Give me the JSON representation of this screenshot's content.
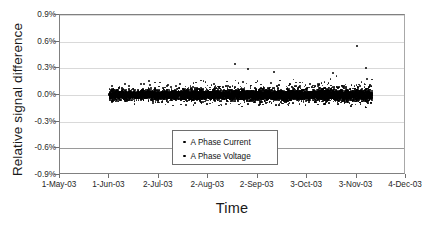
{
  "chart_data": {
    "type": "scatter",
    "title": "",
    "xlabel": "Time",
    "ylabel": "Relative signal difference",
    "grid": true,
    "legend_position": "inside-bottom-center",
    "ylim": [
      -0.9,
      0.9
    ],
    "yticks": [
      "0.9%",
      "0.6%",
      "0.3%",
      "0.0%",
      "-0.3%",
      "-0.6%",
      "-0.9%"
    ],
    "ytick_values": [
      0.9,
      0.6,
      0.3,
      0.0,
      -0.3,
      -0.6,
      -0.9
    ],
    "xticks": [
      "1-May-03",
      "1-Jun-03",
      "2-Jul-03",
      "2-Aug-03",
      "2-Sep-03",
      "3-Oct-03",
      "3-Nov-03",
      "4-Dec-03"
    ],
    "xtick_days": [
      0,
      31,
      62,
      93,
      124,
      155,
      186,
      217
    ],
    "xlim_days": [
      0,
      217
    ],
    "series": [
      {
        "name": "A Phase Current",
        "marker": "dot",
        "color": "#000000",
        "description": "Dense scatter band beginning 1-Jun-03, centered on 0.0%, core spread approx +/-0.08%, full spread approx +/-0.20%, occasional positive outliers to +0.35%, one extreme outlier near 3-Nov-03 at +0.55%"
      },
      {
        "name": "A Phase Voltage",
        "marker": "dot",
        "color": "#000000",
        "description": "Overlapping dense scatter band beginning 1-Jun-03, centered on 0.0%, core spread approx +/-0.06%, full spread approx +/-0.18%"
      }
    ],
    "data_start_day": 31,
    "data_end_day": 196,
    "band_center": 0.0,
    "band_core_halfwidth": 0.075,
    "band_outer_halfwidth": 0.2,
    "outliers": [
      {
        "day": 110,
        "value": 0.35
      },
      {
        "day": 118,
        "value": 0.29
      },
      {
        "day": 186,
        "value": 0.55
      },
      {
        "day": 134,
        "value": 0.26
      },
      {
        "day": 171,
        "value": 0.25
      },
      {
        "day": 192,
        "value": 0.3
      }
    ]
  },
  "legend": {
    "entries": [
      {
        "label": "A Phase Current"
      },
      {
        "label": "A Phase Voltage"
      }
    ]
  }
}
